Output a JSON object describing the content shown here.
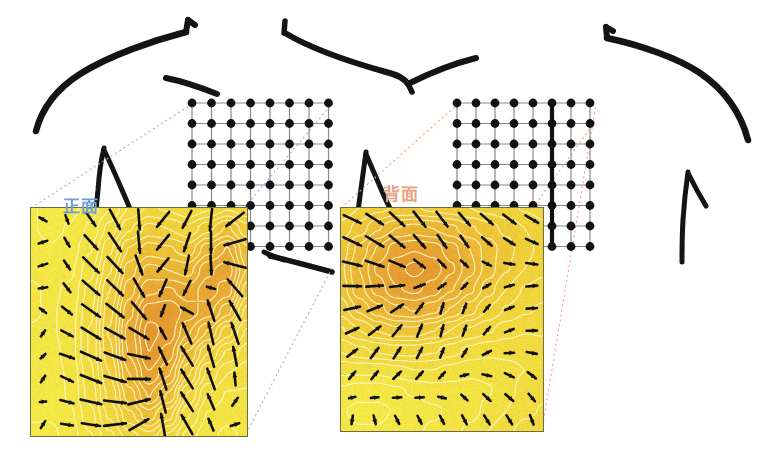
{
  "figure": {
    "title_visible": false,
    "background": "#ffffff",
    "width": 782,
    "height": 462
  },
  "labels": [
    {
      "id": "front",
      "text": "正面",
      "color": "#6d9ed6",
      "x": 63,
      "y": 192,
      "meaning": "front-view",
      "connector_color": "#8fb4dd"
    },
    {
      "id": "back",
      "text": "背面",
      "color": "#e8a184",
      "x": 383,
      "y": 180,
      "meaning": "back-view",
      "connector_color": "#e8a184"
    }
  ],
  "panels": [
    {
      "id": "front-panel",
      "name": "front-heatmap",
      "x": 30,
      "y": 207,
      "w": 216,
      "h": 228,
      "border_color": "#6b6b4a",
      "grid_cols": 8,
      "grid_rows": 8
    },
    {
      "id": "back-panel",
      "name": "back-heatmap",
      "x": 340,
      "y": 207,
      "w": 202,
      "h": 223,
      "border_color": "#6b6b4a",
      "grid_cols": 8,
      "grid_rows": 8
    }
  ],
  "dot_grids": [
    {
      "id": "front-grid",
      "x": 192,
      "y": 103,
      "cols": 8,
      "rows": 8,
      "spacing_x": 19.5,
      "spacing_y": 20.5,
      "dot_color": "#111111",
      "line_color": "#8a8a8a",
      "dot_radius": 4.4,
      "thick_column": null
    },
    {
      "id": "back-grid",
      "x": 457,
      "y": 103,
      "cols": 8,
      "rows": 8,
      "spacing_x": 19.0,
      "spacing_y": 20.5,
      "dot_color": "#111111",
      "line_color": "#8a8a8a",
      "dot_radius": 4.4,
      "thick_column": 5
    }
  ],
  "colors": {
    "yellow_low": "#f5ef4a",
    "yellow": "#f2e231",
    "yellow_mid": "#efd03a",
    "orange": "#e8a13c",
    "orange_deep": "#e3922f",
    "contour": "#fff4c2",
    "arrow": "#101010",
    "sketch": "#141414",
    "panel_border": "#6b6b4a"
  },
  "chart_data": {
    "type": "heatmap",
    "title": "",
    "subtitle": "",
    "xlabel": "",
    "ylabel": "",
    "grid": true,
    "legend_position": "none",
    "colormap": {
      "low": "#f5ef4a",
      "mid": "#efd03a",
      "high": "#e3922f"
    },
    "value_range": [
      0,
      1
    ],
    "panels": [
      {
        "name": "正面",
        "label_en": "front",
        "nx": 12,
        "ny": 12,
        "scalar_field": [
          [
            0.12,
            0.1,
            0.1,
            0.14,
            0.22,
            0.34,
            0.4,
            0.38,
            0.34,
            0.38,
            0.44,
            0.4
          ],
          [
            0.12,
            0.1,
            0.12,
            0.18,
            0.3,
            0.44,
            0.52,
            0.5,
            0.46,
            0.54,
            0.62,
            0.52
          ],
          [
            0.14,
            0.12,
            0.14,
            0.22,
            0.38,
            0.56,
            0.64,
            0.62,
            0.58,
            0.7,
            0.78,
            0.62
          ],
          [
            0.16,
            0.14,
            0.16,
            0.26,
            0.44,
            0.64,
            0.74,
            0.72,
            0.7,
            0.82,
            0.86,
            0.66
          ],
          [
            0.18,
            0.16,
            0.18,
            0.3,
            0.5,
            0.7,
            0.82,
            0.84,
            0.8,
            0.86,
            0.8,
            0.58
          ],
          [
            0.18,
            0.16,
            0.2,
            0.32,
            0.54,
            0.76,
            0.92,
            0.94,
            0.86,
            0.8,
            0.68,
            0.48
          ],
          [
            0.16,
            0.16,
            0.2,
            0.34,
            0.56,
            0.8,
            0.96,
            0.92,
            0.78,
            0.66,
            0.52,
            0.38
          ],
          [
            0.14,
            0.14,
            0.2,
            0.34,
            0.54,
            0.78,
            0.94,
            0.86,
            0.66,
            0.5,
            0.38,
            0.3
          ],
          [
            0.14,
            0.14,
            0.18,
            0.32,
            0.5,
            0.72,
            0.88,
            0.78,
            0.56,
            0.38,
            0.28,
            0.24
          ],
          [
            0.12,
            0.12,
            0.18,
            0.3,
            0.46,
            0.64,
            0.78,
            0.66,
            0.44,
            0.28,
            0.22,
            0.22
          ],
          [
            0.12,
            0.12,
            0.16,
            0.26,
            0.4,
            0.54,
            0.64,
            0.52,
            0.34,
            0.22,
            0.18,
            0.2
          ],
          [
            0.1,
            0.1,
            0.14,
            0.22,
            0.32,
            0.42,
            0.48,
            0.38,
            0.26,
            0.18,
            0.16,
            0.18
          ]
        ],
        "vector_field_note": "arrows converge toward the central high-value ridge and swirl clockwise at right"
      },
      {
        "name": "背面",
        "label_en": "back",
        "nx": 12,
        "ny": 12,
        "scalar_field": [
          [
            0.46,
            0.5,
            0.54,
            0.56,
            0.56,
            0.54,
            0.52,
            0.5,
            0.48,
            0.46,
            0.44,
            0.42
          ],
          [
            0.52,
            0.58,
            0.66,
            0.72,
            0.74,
            0.72,
            0.68,
            0.62,
            0.58,
            0.54,
            0.5,
            0.46
          ],
          [
            0.58,
            0.68,
            0.78,
            0.86,
            0.88,
            0.86,
            0.8,
            0.72,
            0.64,
            0.58,
            0.52,
            0.48
          ],
          [
            0.6,
            0.72,
            0.84,
            0.92,
            0.96,
            0.92,
            0.84,
            0.74,
            0.64,
            0.56,
            0.5,
            0.46
          ],
          [
            0.58,
            0.7,
            0.8,
            0.88,
            0.9,
            0.86,
            0.78,
            0.68,
            0.58,
            0.5,
            0.44,
            0.42
          ],
          [
            0.52,
            0.62,
            0.7,
            0.76,
            0.78,
            0.74,
            0.66,
            0.58,
            0.5,
            0.44,
            0.4,
            0.38
          ],
          [
            0.44,
            0.5,
            0.56,
            0.6,
            0.6,
            0.56,
            0.5,
            0.44,
            0.4,
            0.36,
            0.34,
            0.34
          ],
          [
            0.34,
            0.38,
            0.4,
            0.42,
            0.42,
            0.4,
            0.36,
            0.32,
            0.3,
            0.3,
            0.3,
            0.32
          ],
          [
            0.24,
            0.24,
            0.24,
            0.26,
            0.28,
            0.28,
            0.26,
            0.24,
            0.24,
            0.26,
            0.28,
            0.3
          ],
          [
            0.16,
            0.14,
            0.14,
            0.16,
            0.18,
            0.2,
            0.2,
            0.2,
            0.22,
            0.26,
            0.3,
            0.32
          ],
          [
            0.12,
            0.1,
            0.1,
            0.12,
            0.14,
            0.16,
            0.18,
            0.2,
            0.24,
            0.28,
            0.32,
            0.34
          ],
          [
            0.14,
            0.12,
            0.12,
            0.14,
            0.16,
            0.18,
            0.2,
            0.24,
            0.28,
            0.32,
            0.36,
            0.38
          ]
        ],
        "vector_field_note": "arrows flow mainly rightward across the upper band, turning downward at the lower-left low region"
      }
    ]
  },
  "sketch": {
    "name": "torso-outline",
    "stroke_color": "#141414",
    "description": "hand-drawn human torso: shoulders, collarbones, arms"
  }
}
